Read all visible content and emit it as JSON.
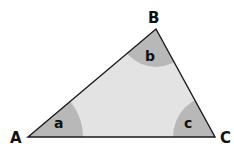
{
  "diagram": {
    "type": "triangle",
    "vertices": [
      {
        "id": "A",
        "label": "A",
        "x": 28,
        "y": 137
      },
      {
        "id": "B",
        "label": "B",
        "x": 156,
        "y": 29
      },
      {
        "id": "C",
        "label": "C",
        "x": 215,
        "y": 137
      }
    ],
    "angles": [
      {
        "vertex": "A",
        "label": "a"
      },
      {
        "vertex": "B",
        "label": "b"
      },
      {
        "vertex": "C",
        "label": "c"
      }
    ],
    "colors": {
      "fill": "#e3e3e3",
      "angle_fill": "#b8b8b8",
      "stroke": "#1a1a1a"
    }
  }
}
